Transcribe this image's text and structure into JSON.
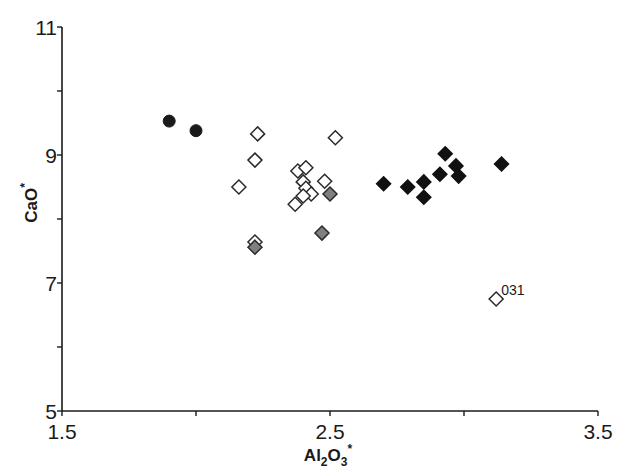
{
  "chart_data": {
    "type": "scatter",
    "title": "",
    "xlabel": "Al2O3*",
    "xlabel_parts": {
      "base": "Al",
      "sub1": "2",
      "mid": "O",
      "sub2": "3",
      "sup": "*"
    },
    "ylabel": "CaO*",
    "ylabel_parts": {
      "base": "CaO",
      "sup": "*"
    },
    "xlim": [
      1.5,
      3.5
    ],
    "ylim": [
      5,
      11
    ],
    "x_ticks": [
      {
        "value": 1.5,
        "label": "1.5"
      },
      {
        "value": 2.0,
        "label": ""
      },
      {
        "value": 2.5,
        "label": "2.5"
      },
      {
        "value": 3.0,
        "label": ""
      },
      {
        "value": 3.5,
        "label": "3.5"
      }
    ],
    "y_ticks": [
      {
        "value": 5,
        "label": "5"
      },
      {
        "value": 6,
        "label": ""
      },
      {
        "value": 7,
        "label": "7"
      },
      {
        "value": 8,
        "label": ""
      },
      {
        "value": 9,
        "label": "9"
      },
      {
        "value": 10,
        "label": ""
      },
      {
        "value": 11,
        "label": "11"
      }
    ],
    "grid": false,
    "legend": null,
    "series": [
      {
        "name": "black circles",
        "marker": "circle",
        "fill": "#1a1a1a",
        "stroke": "#1a1a1a",
        "points": [
          [
            1.9,
            9.53
          ],
          [
            2.0,
            9.38
          ]
        ]
      },
      {
        "name": "open diamonds",
        "marker": "diamond",
        "fill": "#ffffff",
        "stroke": "#2a2a2a",
        "points": [
          [
            2.23,
            9.33
          ],
          [
            2.22,
            8.92
          ],
          [
            2.16,
            8.5
          ],
          [
            2.52,
            9.27
          ],
          [
            2.48,
            8.59
          ],
          [
            2.22,
            7.64
          ],
          [
            2.38,
            8.75
          ],
          [
            2.41,
            8.8
          ],
          [
            2.4,
            8.58
          ],
          [
            2.41,
            8.48
          ],
          [
            2.43,
            8.39
          ],
          [
            2.4,
            8.36
          ],
          [
            2.37,
            8.23
          ],
          [
            3.12,
            6.75
          ]
        ]
      },
      {
        "name": "gray diamonds",
        "marker": "diamond",
        "fill": "#7f7f7f",
        "stroke": "#2a2a2a",
        "points": [
          [
            2.5,
            8.39
          ],
          [
            2.47,
            7.78
          ],
          [
            2.22,
            7.56
          ]
        ]
      },
      {
        "name": "black diamonds",
        "marker": "diamond",
        "fill": "#111111",
        "stroke": "#111111",
        "points": [
          [
            2.7,
            8.55
          ],
          [
            2.79,
            8.5
          ],
          [
            2.85,
            8.58
          ],
          [
            2.85,
            8.34
          ],
          [
            2.91,
            8.7
          ],
          [
            2.93,
            9.02
          ],
          [
            2.97,
            8.83
          ],
          [
            2.98,
            8.67
          ],
          [
            3.14,
            8.86
          ]
        ]
      }
    ],
    "annotations": [
      {
        "text": "031",
        "x": 3.12,
        "y": 6.75
      }
    ]
  },
  "plot_area": {
    "left": 62,
    "right": 598,
    "top": 27,
    "bottom": 411
  }
}
